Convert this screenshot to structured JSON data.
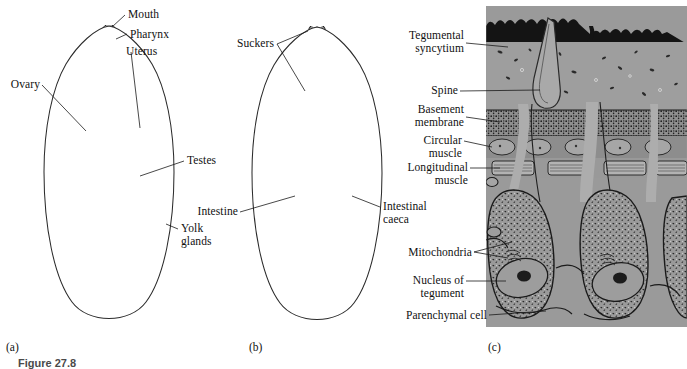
{
  "figure": {
    "caption": "Figure 27.8",
    "panels": [
      {
        "id": "a",
        "label": "(a)"
      },
      {
        "id": "b",
        "label": "(b)"
      },
      {
        "id": "c",
        "label": "(c)"
      }
    ]
  },
  "panel_a": {
    "id_label": "(a)",
    "labels": [
      {
        "name": "mouth",
        "text": "Mouth"
      },
      {
        "name": "pharynx",
        "text": "Pharynx"
      },
      {
        "name": "uterus",
        "text": "Uterus"
      },
      {
        "name": "ovary",
        "text": "Ovary"
      },
      {
        "name": "testes",
        "text": "Testes"
      },
      {
        "name": "yolk-glands",
        "text": "Yolk\nglands"
      }
    ]
  },
  "panel_b": {
    "id_label": "(b)",
    "labels": [
      {
        "name": "suckers",
        "text": "Suckers"
      },
      {
        "name": "intestine",
        "text": "Intestine"
      },
      {
        "name": "intestinal-caeca",
        "text": "Intestinal\ncaeca"
      }
    ]
  },
  "panel_c": {
    "id_label": "(c)",
    "labels": [
      {
        "name": "tegumental-syncytium",
        "text": "Tegumental\nsyncytium"
      },
      {
        "name": "spine",
        "text": "Spine"
      },
      {
        "name": "basement-membrane",
        "text": "Basement\nmembrane"
      },
      {
        "name": "circular-muscle",
        "text": "Circular\nmuscle"
      },
      {
        "name": "longitudinal-muscle",
        "text": "Longitudinal\nmuscle"
      },
      {
        "name": "mitochondria",
        "text": "Mitochondria"
      },
      {
        "name": "nucleus-of-tegument",
        "text": "Nucleus of\ntegument"
      },
      {
        "name": "parenchymal-cell",
        "text": "Parenchymal cell"
      }
    ]
  },
  "colors": {
    "ink": "#1a1a1a",
    "yolk_gland_gray": "#b9b9b9",
    "caeca_gray": "#cbcbcb",
    "tegument_gray": "#9a9a9a",
    "dark_organ": "#2a2a2a",
    "background": "#ffffff"
  }
}
